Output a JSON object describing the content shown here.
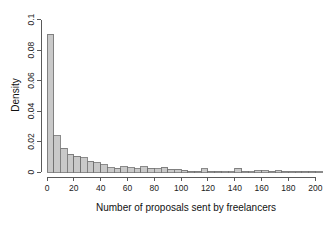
{
  "chart_data": {
    "type": "bar",
    "title": "",
    "subtitle": "",
    "xlabel": "Number of proposals sent by freelancers",
    "ylabel": "Density",
    "xlim": [
      0,
      205
    ],
    "ylim": [
      0,
      0.105
    ],
    "grid": false,
    "legend": null,
    "bin_width": 5,
    "xticks": [
      0,
      20,
      40,
      60,
      80,
      100,
      120,
      140,
      160,
      180,
      200
    ],
    "xtick_labels": [
      "0",
      "20",
      "40",
      "60",
      "80",
      "100",
      "120",
      "140",
      "160",
      "180",
      "200"
    ],
    "yticks": [
      0,
      0.02,
      0.04,
      0.06,
      0.08,
      0.1
    ],
    "ytick_labels": [
      "0",
      "0.02",
      "0.04",
      "0.06",
      "0.08",
      "0.1"
    ],
    "bin_starts": [
      0,
      5,
      10,
      15,
      20,
      25,
      30,
      35,
      40,
      45,
      50,
      55,
      60,
      65,
      70,
      75,
      80,
      85,
      90,
      95,
      100,
      105,
      110,
      115,
      120,
      125,
      130,
      135,
      140,
      145,
      150,
      155,
      160,
      165,
      170,
      175,
      180,
      185,
      190,
      195,
      200
    ],
    "categories": [
      "0-5",
      "5-10",
      "10-15",
      "15-20",
      "20-25",
      "25-30",
      "30-35",
      "35-40",
      "40-45",
      "45-50",
      "50-55",
      "55-60",
      "60-65",
      "65-70",
      "70-75",
      "75-80",
      "80-85",
      "85-90",
      "90-95",
      "95-100",
      "100-105",
      "105-110",
      "110-115",
      "115-120",
      "120-125",
      "125-130",
      "130-135",
      "135-140",
      "140-145",
      "145-150",
      "150-155",
      "155-160",
      "160-165",
      "165-170",
      "170-175",
      "175-180",
      "180-185",
      "185-190",
      "190-195",
      "195-200",
      "200-205"
    ],
    "values": [
      0.0905,
      0.0237,
      0.0157,
      0.0118,
      0.0103,
      0.0092,
      0.0072,
      0.006,
      0.0047,
      0.0028,
      0.0026,
      0.0033,
      0.0027,
      0.0022,
      0.0035,
      0.0025,
      0.0022,
      0.003,
      0.0018,
      0.0019,
      0.0013,
      0.0004,
      0.0004,
      0.0022,
      0.0004,
      0.0004,
      0.0003,
      0.0003,
      0.0025,
      0.0004,
      0.0002,
      0.0008,
      0.0007,
      0.0006,
      0.0007,
      0.0006,
      0.0006,
      0.0004,
      0.0004,
      0.0004,
      0.0003
    ],
    "colors": {
      "bar_fill": "#c9c9c9",
      "bar_stroke": "#6e6e6e",
      "axis": "#5a5a5a",
      "text": "#111111",
      "background": "#ffffff"
    }
  }
}
